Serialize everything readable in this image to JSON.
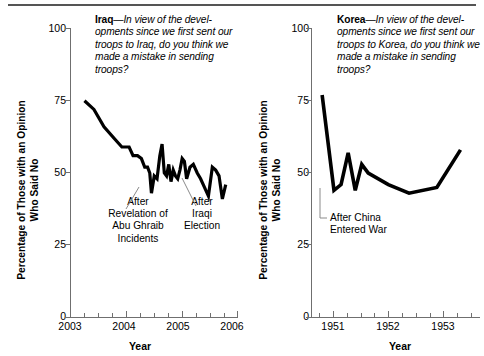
{
  "chart_data": [
    {
      "type": "line",
      "id": "iraq",
      "topic": "Iraq",
      "title": "Iraq—In view of the developments since we first sent our troops to Iraq, do you think we made a mistake in sending troops?",
      "title_lines": [
        "—In view of the devel-",
        "opments since we first sent",
        "our troops to Iraq, do you",
        "think we made a mistake in",
        "sending troops?"
      ],
      "xlabel": "Year",
      "ylabel": "Percentage of Those with an Opinion Who Said No",
      "xlim": [
        2003,
        2006
      ],
      "ylim": [
        0,
        100
      ],
      "yticks": [
        0,
        25,
        50,
        75,
        100
      ],
      "xticks": [
        2003,
        2004,
        2005,
        2006
      ],
      "xminor_step": 0.25,
      "grid": false,
      "legend": "none",
      "annotations": [
        {
          "id": "abu-ghraib",
          "lines": [
            "After",
            "Revelation of",
            "Abu Ghraib",
            "Incidents"
          ],
          "points_to_x": 2004.45,
          "points_to_y": 43
        },
        {
          "id": "iraqi-election",
          "lines": [
            "After",
            "Iraqi",
            "Election"
          ],
          "points_to_x": 2005.08,
          "points_to_y": 48
        }
      ],
      "x": [
        2003.25,
        2003.42,
        2003.6,
        2003.78,
        2003.92,
        2004.05,
        2004.12,
        2004.2,
        2004.27,
        2004.33,
        2004.38,
        2004.42,
        2004.45,
        2004.5,
        2004.55,
        2004.6,
        2004.64,
        2004.68,
        2004.72,
        2004.76,
        2004.8,
        2004.84,
        2004.88,
        2004.92,
        2004.96,
        2005.0,
        2005.04,
        2005.08,
        2005.14,
        2005.2,
        2005.27,
        2005.33,
        2005.4,
        2005.47,
        2005.54,
        2005.6,
        2005.66,
        2005.72,
        2005.78
      ],
      "y": [
        75,
        72,
        66,
        62,
        59,
        59,
        56,
        56,
        55,
        52,
        52,
        50,
        43,
        49,
        48,
        56,
        60,
        50,
        49,
        53,
        47,
        51,
        49,
        48,
        51,
        55,
        54,
        48,
        52,
        53,
        50,
        48,
        45,
        42,
        52,
        51,
        49,
        41,
        46
      ]
    },
    {
      "type": "line",
      "id": "korea",
      "topic": "Korea",
      "title": "Korea—In view of the developments since we first sent our troops to Korea, do you think we made a mistake in sending troops?",
      "title_lines": [
        "—In view of the devel-",
        "opments since we first sent",
        "our troops to Korea, do you",
        "think we made a mistake in",
        "sending troops?"
      ],
      "xlabel": "Year",
      "ylabel": "Percentage of Those with an Opinion Who Said No",
      "xlim": [
        1950.6,
        1953.45
      ],
      "ylim": [
        0,
        100
      ],
      "yticks": [
        0,
        25,
        50,
        75,
        100
      ],
      "xticks": [
        1951,
        1952,
        1953
      ],
      "xminor_step": 0.25,
      "grid": false,
      "legend": "none",
      "annotations": [
        {
          "id": "china-entered-war",
          "lines": [
            "After China",
            "Entered War"
          ],
          "points_to_x": 1950.98,
          "points_to_y": 44
        }
      ],
      "x": [
        1950.78,
        1950.98,
        1951.1,
        1951.22,
        1951.34,
        1951.45,
        1951.56,
        1951.9,
        1952.25,
        1952.72,
        1953.12
      ],
      "y": [
        77,
        44,
        46,
        57,
        44,
        53,
        50,
        46,
        43,
        45,
        58
      ]
    }
  ],
  "figure": {
    "background": "#ffffff",
    "line_color": "#000000",
    "axis_color": "#6f6f6f",
    "rule_color": "#555555"
  }
}
